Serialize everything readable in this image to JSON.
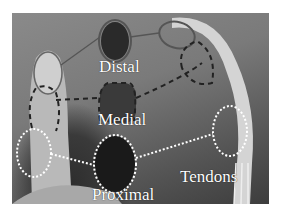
{
  "figure": {
    "labels": {
      "distal": "Distal",
      "medial": "Medial",
      "proximal": "Proximal",
      "tendons": "Tendons"
    },
    "colors": {
      "annotation_white": "#ffffff",
      "annotation_dark": "#1a1a1a",
      "background_gray": "#7a7a7a"
    }
  }
}
